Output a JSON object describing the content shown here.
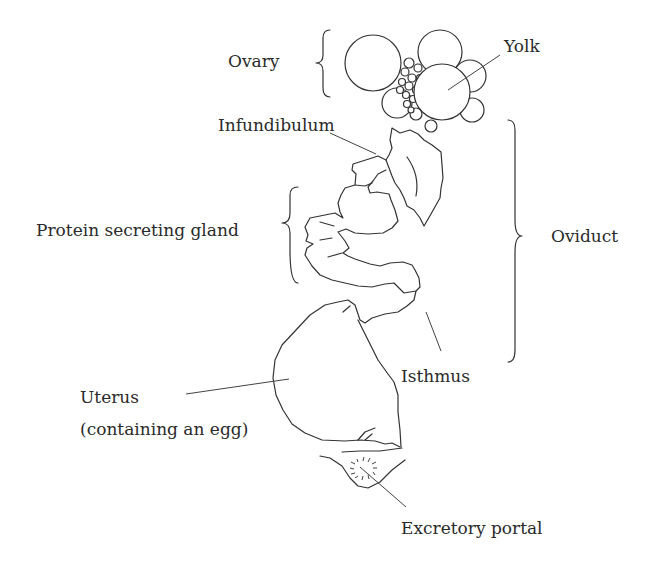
{
  "diagram": {
    "labels": {
      "ovary": "Ovary",
      "yolk": "Yolk",
      "infundibulum": "Infundibulum",
      "protein_gland": "Protein secreting gland",
      "oviduct": "Oviduct",
      "isthmus": "Isthmus",
      "uterus_line1": "Uterus",
      "uterus_line2": "(containing an egg)",
      "excretory": "Excretory portal"
    },
    "colors": {
      "line": "#333333",
      "text": "#2a2a2a",
      "background": "#ffffff"
    }
  }
}
